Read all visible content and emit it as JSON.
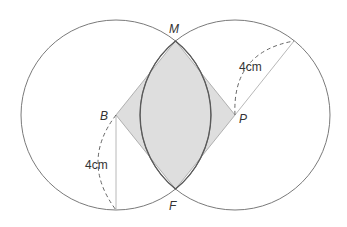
{
  "diagram": {
    "type": "geometry",
    "colors": {
      "background": "#ffffff",
      "circle_stroke": "#7a7a7a",
      "lens_stroke": "#5a5a5a",
      "shade_fill": "#dedede",
      "rhombus_edge": "#b0b0b0",
      "radius_line": "#b8b8b8",
      "dashed_arc": "#666666",
      "label_text": "#333333"
    },
    "points": {
      "B": {
        "label": "B",
        "x": 116,
        "y": 115
      },
      "P": {
        "label": "P",
        "x": 235,
        "y": 115
      },
      "M": {
        "label": "M",
        "x": 175.5,
        "y": 41
      },
      "F": {
        "label": "F",
        "x": 175.5,
        "y": 189
      }
    },
    "circles": [
      {
        "name": "circle-B",
        "center": "B",
        "radius_px": 95
      },
      {
        "name": "circle-P",
        "center": "P",
        "radius_px": 95
      }
    ],
    "measurements": {
      "left_radius_label": "4cm",
      "right_radius_label": "4cm"
    },
    "labels": {
      "M": "M",
      "F": "F",
      "B": "B",
      "P": "P"
    }
  }
}
